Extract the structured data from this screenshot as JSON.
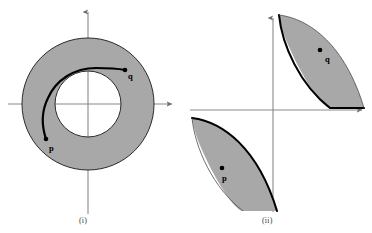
{
  "figure": {
    "background_color": "#ffffff",
    "region_fill_color": "#a8a8a8",
    "region_stroke_color": "#000000",
    "axis_color": "#8a8a8a",
    "curve_color": "#000000",
    "point_color": "#000000"
  },
  "panels": [
    {
      "id": "i",
      "caption": "(i)",
      "shape_name": "annulus",
      "center": {
        "x": 88,
        "y": 104
      },
      "outer_radius": 66,
      "inner_radius": 33,
      "axes": {
        "x_axis_y": 104,
        "y_axis_x": 88,
        "x_axis_from": 8,
        "x_axis_to": 176,
        "y_axis_from": 8,
        "y_axis_to": 214
      },
      "points": [
        {
          "name": "p",
          "label": "p",
          "x": 46,
          "y": 139
        },
        {
          "name": "q",
          "label": "q",
          "x": 125,
          "y": 70
        }
      ],
      "curve_description": "arc from p counterclockwise over the top of the inner hole to q"
    },
    {
      "id": "ii",
      "caption": "(ii)",
      "shape_name": "two-crescent-regions",
      "axes": {
        "x_axis_y": 110,
        "y_axis_x": 273,
        "x_axis_from": 190,
        "x_axis_to": 366,
        "y_axis_from": 14,
        "y_axis_to": 212
      },
      "points": [
        {
          "name": "p",
          "label": "p",
          "x": 222,
          "y": 168
        },
        {
          "name": "q",
          "label": "q",
          "x": 320,
          "y": 50
        }
      ],
      "regions": [
        {
          "name": "upper-right-crescent",
          "quadrant": 1
        },
        {
          "name": "lower-left-crescent",
          "quadrant": 3
        }
      ]
    }
  ]
}
